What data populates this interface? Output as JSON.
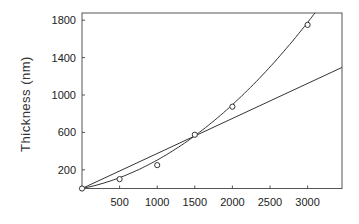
{
  "chart_data": {
    "type": "scatter",
    "title": "",
    "xlabel": "",
    "ylabel": "Thickness (nm)",
    "xlim": [
      0,
      3470
    ],
    "ylim": [
      0,
      1920
    ],
    "x_ticks": [
      500,
      1000,
      1500,
      2000,
      2500,
      3000
    ],
    "y_ticks": [
      200,
      600,
      1000,
      1400,
      1800
    ],
    "grid": false,
    "legend": null,
    "series": [
      {
        "name": "measured",
        "type": "scatter",
        "marker": "open-circle",
        "x": [
          0,
          500,
          1000,
          1500,
          2000,
          3000
        ],
        "y": [
          0,
          100,
          250,
          575,
          875,
          1750
        ]
      },
      {
        "name": "quadratic-fit",
        "type": "line",
        "description": "curved fit through points",
        "x": [
          0,
          500,
          1000,
          1500,
          2000,
          2500,
          3000,
          3120
        ],
        "y": [
          0,
          115,
          280,
          540,
          880,
          1280,
          1750,
          1920
        ]
      },
      {
        "name": "linear-fit",
        "type": "line",
        "description": "straight line from origin",
        "x": [
          0,
          3470
        ],
        "y": [
          0,
          1300
        ]
      }
    ]
  },
  "colors": {
    "line": "#333333",
    "frame": "#555555",
    "text": "#222222"
  }
}
